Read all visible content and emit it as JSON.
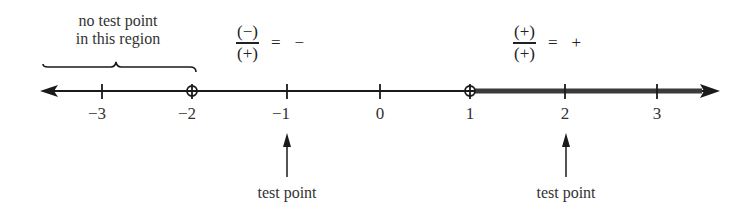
{
  "region_note": {
    "line1": "no test point",
    "line2": "in this region"
  },
  "fractions": [
    {
      "numerator": "(−)",
      "denominator": "(+)",
      "equals": "=",
      "result": "−"
    },
    {
      "numerator": "(+)",
      "denominator": "(+)",
      "equals": "=",
      "result": "+"
    }
  ],
  "number_line": {
    "ticks": [
      {
        "value": -3,
        "label": "−3"
      },
      {
        "value": -2,
        "label": "−2"
      },
      {
        "value": -1,
        "label": "−1"
      },
      {
        "value": 0,
        "label": "0"
      },
      {
        "value": 1,
        "label": "1"
      },
      {
        "value": 2,
        "label": "2"
      },
      {
        "value": 3,
        "label": "3"
      }
    ],
    "open_points": [
      -2,
      1
    ],
    "shaded_interval": "(1, ∞)"
  },
  "test_points": [
    {
      "at": -1,
      "label": "test point"
    },
    {
      "at": 2,
      "label": "test point"
    }
  ],
  "colors": {
    "line": "#1a1a1a",
    "shaded": "#3a3a3a",
    "text": "#333333"
  }
}
